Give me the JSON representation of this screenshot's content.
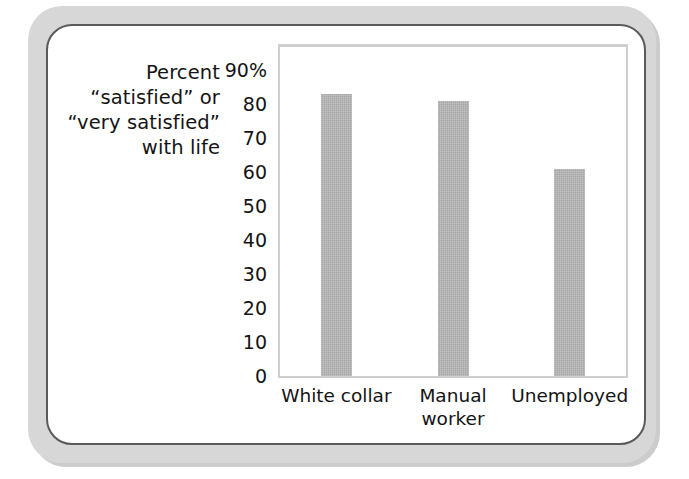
{
  "chart_data": {
    "type": "bar",
    "title": "",
    "subtitle": "",
    "xlabel": "",
    "ylabel": "Percent “satisfied” or “very satisfied” with life",
    "ylabel_lines": [
      "Percent",
      "“satisfied” or",
      "“very satisfied”",
      "with life"
    ],
    "categories": [
      "White collar",
      "Manual worker",
      "Unemployed"
    ],
    "category_label_lines": [
      [
        "White collar"
      ],
      [
        "Manual",
        "worker"
      ],
      [
        "Unemployed"
      ]
    ],
    "values": [
      83,
      81,
      61
    ],
    "ylim": [
      0,
      90
    ],
    "ytick_values": [
      90,
      80,
      70,
      60,
      50,
      40,
      30,
      20,
      10,
      0
    ],
    "ytick_labels": [
      "90%",
      "80",
      "70",
      "60",
      "50",
      "40",
      "30",
      "20",
      "10",
      "0"
    ],
    "grid": true,
    "grid_axis": "y",
    "legend": false,
    "legend_position": "none",
    "bar_color": "#a6a6a6",
    "gridline_color": "#c9c9c9",
    "axis_color": "#cfcfcf",
    "text_color": "#141414",
    "plot_background": "#ffffff",
    "units": "percent"
  },
  "frame": {
    "card_background": "#ffffff",
    "card_border_color": "#5a5a5a",
    "outer_band_color": "#d7d7d7",
    "page_background": "#ffffff"
  }
}
